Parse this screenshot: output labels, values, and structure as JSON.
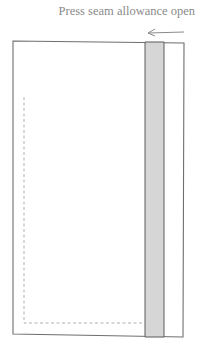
{
  "diagram": {
    "caption": "Press seam allowance open",
    "arrow_direction": "left",
    "colors": {
      "outline": "#6e6e6e",
      "seam_fill": "#d6d6d6",
      "stitch_line": "#a8a8a8",
      "caption": "#8a8a8a"
    }
  }
}
